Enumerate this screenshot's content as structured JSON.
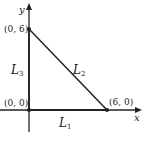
{
  "diagram": {
    "axes": {
      "x_label": "x",
      "y_label": "y"
    },
    "points": [
      {
        "id": "p06",
        "label": "(0, 6)",
        "coords": [
          0,
          6
        ]
      },
      {
        "id": "p00",
        "label": "(0, 0)",
        "coords": [
          0,
          0
        ]
      },
      {
        "id": "p60",
        "label": "(6, 0)",
        "coords": [
          6,
          0
        ]
      }
    ],
    "segments": [
      {
        "id": "L1",
        "base": "L",
        "sub": "1",
        "from": "(0, 0)",
        "to": "(6, 0)"
      },
      {
        "id": "L2",
        "base": "L",
        "sub": "2",
        "from": "(0, 6)",
        "to": "(6, 0)"
      },
      {
        "id": "L3",
        "base": "L",
        "sub": "3",
        "from": "(0, 0)",
        "to": "(0, 6)"
      }
    ],
    "colors": {
      "line": "#222222",
      "background": "#ffffff"
    }
  }
}
